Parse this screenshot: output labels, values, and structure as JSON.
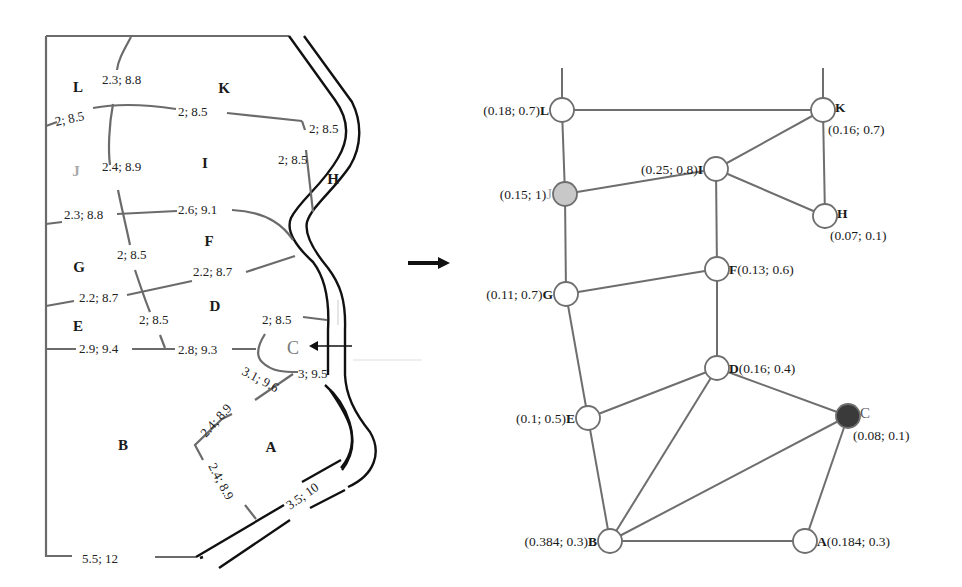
{
  "map": {
    "zones": [
      {
        "id": "L",
        "x": 78,
        "y": 92,
        "color": "#1a1a1a"
      },
      {
        "id": "K",
        "x": 224,
        "y": 93,
        "color": "#1a1a1a"
      },
      {
        "id": "J",
        "x": 76,
        "y": 176,
        "color": "#a8a8a8"
      },
      {
        "id": "I",
        "x": 205,
        "y": 168,
        "color": "#1a1a1a"
      },
      {
        "id": "H",
        "x": 333,
        "y": 184,
        "color": "#1a1a1a"
      },
      {
        "id": "F",
        "x": 209,
        "y": 246,
        "color": "#1a1a1a"
      },
      {
        "id": "G",
        "x": 79,
        "y": 272,
        "color": "#1a1a1a"
      },
      {
        "id": "D",
        "x": 215,
        "y": 311,
        "color": "#1a1a1a"
      },
      {
        "id": "E",
        "x": 78,
        "y": 331,
        "color": "#1a1a1a"
      },
      {
        "id": "C",
        "x": 293,
        "y": 354,
        "color": "#7a7a7a"
      },
      {
        "id": "B",
        "x": 123,
        "y": 450,
        "color": "#1a1a1a"
      },
      {
        "id": "A",
        "x": 271,
        "y": 452,
        "color": "#1a1a1a"
      }
    ],
    "edge_labels": [
      {
        "text": "2.3; 8.8",
        "x": 102,
        "y": 84,
        "rot": 0
      },
      {
        "text": "2; 8.5",
        "x": 56,
        "y": 126,
        "rot": -12
      },
      {
        "text": "2; 8.5",
        "x": 178,
        "y": 116,
        "rot": 0
      },
      {
        "text": "2; 8.5",
        "x": 309,
        "y": 133,
        "rot": 0
      },
      {
        "text": "2; 8.5",
        "x": 278,
        "y": 164,
        "rot": 0
      },
      {
        "text": "2.4; 8.9",
        "x": 102,
        "y": 171,
        "rot": 0
      },
      {
        "text": "2.3; 8.8",
        "x": 64,
        "y": 219,
        "rot": 0
      },
      {
        "text": "2.6; 9.1",
        "x": 178,
        "y": 214,
        "rot": 0
      },
      {
        "text": "2; 8.5",
        "x": 117,
        "y": 259,
        "rot": 0
      },
      {
        "text": "2.2; 8.7",
        "x": 193,
        "y": 276,
        "rot": 0
      },
      {
        "text": "2.2; 8.7",
        "x": 79,
        "y": 302,
        "rot": 0
      },
      {
        "text": "2; 8.5",
        "x": 139,
        "y": 324,
        "rot": 0
      },
      {
        "text": "2; 8.5",
        "x": 262,
        "y": 324,
        "rot": 0
      },
      {
        "text": "2.9; 9.4",
        "x": 79,
        "y": 353,
        "rot": 0
      },
      {
        "text": "2.8; 9.3",
        "x": 178,
        "y": 354,
        "rot": 0
      },
      {
        "text": "3.1; 9.6",
        "x": 241,
        "y": 374,
        "rot": 28
      },
      {
        "text": "3; 9.5",
        "x": 298,
        "y": 378,
        "rot": 0
      },
      {
        "text": "2.4; 8.9",
        "x": 206,
        "y": 438,
        "rot": -48
      },
      {
        "text": "2.4; 8.9",
        "x": 208,
        "y": 466,
        "rot": 62
      },
      {
        "text": "3.5; 10",
        "x": 290,
        "y": 510,
        "rot": -35
      },
      {
        "text": "5.5; 12",
        "x": 82,
        "y": 563,
        "rot": 0
      }
    ]
  },
  "graph": {
    "nodes": [
      {
        "id": "L",
        "cx": 562,
        "cy": 110,
        "fill": "#ffffff",
        "label": "(0.18; 0.7)",
        "pos": "left",
        "bold_id": true
      },
      {
        "id": "K",
        "cx": 823,
        "cy": 110,
        "fill": "#ffffff",
        "label": "(0.16; 0.7)",
        "pos": "right-below",
        "bold_id": true
      },
      {
        "id": "I",
        "cx": 716,
        "cy": 169,
        "fill": "#ffffff",
        "label": "(0.25; 0.8)",
        "pos": "left",
        "bold_id": true
      },
      {
        "id": "J",
        "cx": 565,
        "cy": 194,
        "fill": "#c8c8c8",
        "label": "(0.15; 1)",
        "pos": "left",
        "bold_id": false,
        "id_color": "#a8a8a8"
      },
      {
        "id": "H",
        "cx": 825,
        "cy": 216,
        "fill": "#ffffff",
        "label": "(0.07; 0.1)",
        "pos": "right-below",
        "bold_id": true
      },
      {
        "id": "F",
        "cx": 717,
        "cy": 269,
        "fill": "#ffffff",
        "label": "(0.13; 0.6)",
        "pos": "right",
        "bold_id": true
      },
      {
        "id": "G",
        "cx": 566,
        "cy": 294,
        "fill": "#ffffff",
        "label": "(0.11; 0.7)",
        "pos": "left",
        "bold_id": true
      },
      {
        "id": "D",
        "cx": 717,
        "cy": 368,
        "fill": "#ffffff",
        "label": "(0.16; 0.4)",
        "pos": "right",
        "bold_id": true
      },
      {
        "id": "C",
        "cx": 848,
        "cy": 416,
        "fill": "#3a3a3a",
        "label": "(0.08; 0.1)",
        "pos": "right-below",
        "bold_id": false,
        "id_color": "#555555"
      },
      {
        "id": "E",
        "cx": 588,
        "cy": 418,
        "fill": "#ffffff",
        "label": "(0.1; 0.5)",
        "pos": "left",
        "bold_id": true
      },
      {
        "id": "B",
        "cx": 610,
        "cy": 541,
        "fill": "#ffffff",
        "label": "(0.384; 0.3)",
        "pos": "left",
        "bold_id": true
      },
      {
        "id": "A",
        "cx": 805,
        "cy": 541,
        "fill": "#ffffff",
        "label": "(0.184; 0.3)",
        "pos": "right",
        "bold_id": true
      }
    ],
    "edges": [
      [
        "L",
        "K"
      ],
      [
        "L",
        "J"
      ],
      [
        "J",
        "I"
      ],
      [
        "I",
        "K"
      ],
      [
        "I",
        "H"
      ],
      [
        "K",
        "H"
      ],
      [
        "I",
        "F"
      ],
      [
        "J",
        "G"
      ],
      [
        "G",
        "F"
      ],
      [
        "F",
        "D"
      ],
      [
        "G",
        "E"
      ],
      [
        "E",
        "D"
      ],
      [
        "D",
        "C"
      ],
      [
        "D",
        "B"
      ],
      [
        "E",
        "B"
      ],
      [
        "B",
        "C"
      ],
      [
        "B",
        "A"
      ],
      [
        "A",
        "C"
      ]
    ]
  },
  "transform_arrow": {
    "from": "map",
    "to": "graph",
    "direction": "right"
  }
}
